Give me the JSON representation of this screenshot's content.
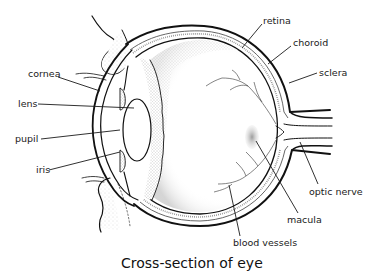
{
  "diagram": {
    "title": "Cross-section of eye",
    "colors": {
      "ink": "#111111",
      "stipple": "#9a9a9a",
      "macula": "#b8b8b8",
      "background": "#ffffff"
    },
    "labels": {
      "retina": "retina",
      "choroid": "choroid",
      "sclera": "sclera",
      "cornea": "cornea",
      "lens": "lens",
      "pupil": "pupil",
      "iris": "iris",
      "optic_nerve": "optic nerve",
      "macula": "macula",
      "blood_vessels": "blood vessels"
    }
  }
}
